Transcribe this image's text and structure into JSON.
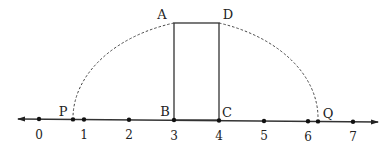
{
  "diagram": {
    "type": "number-line-construction",
    "number_line": {
      "ticks": [
        {
          "value": 0,
          "label": "0",
          "x": 39
        },
        {
          "value": 1,
          "label": "1",
          "x": 84
        },
        {
          "value": 2,
          "label": "2",
          "x": 129
        },
        {
          "value": 3,
          "label": "3",
          "x": 174
        },
        {
          "value": 4,
          "label": "4",
          "x": 219
        },
        {
          "value": 5,
          "label": "5",
          "x": 264
        },
        {
          "value": 6,
          "label": "6",
          "x": 308
        },
        {
          "value": 7,
          "label": "7",
          "x": 353
        }
      ]
    },
    "points": {
      "A": {
        "label": "A"
      },
      "B": {
        "label": "B"
      },
      "C": {
        "label": "C"
      },
      "D": {
        "label": "D"
      },
      "P": {
        "label": "P"
      },
      "Q": {
        "label": "Q"
      }
    },
    "shapes": {
      "rectangle": "ABCD",
      "arcs": [
        "A to P (dashed, centered at C)",
        "D to Q (dashed, centered at B)"
      ]
    }
  }
}
